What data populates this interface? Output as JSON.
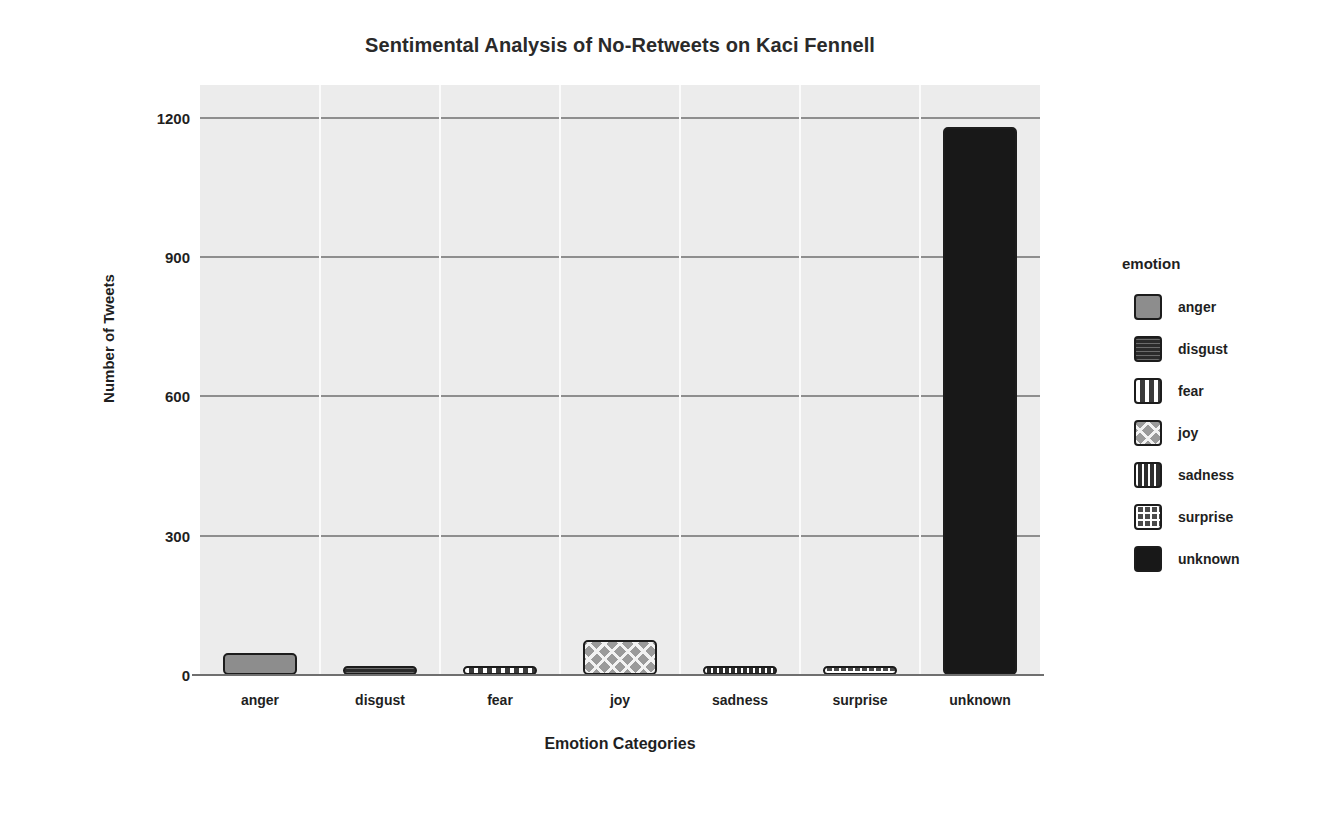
{
  "chart_data": {
    "type": "bar",
    "title": "Sentimental Analysis of No-Retweets on Kaci Fennell",
    "xlabel": "Emotion Categories",
    "ylabel": "Number of Tweets",
    "categories": [
      "anger",
      "disgust",
      "fear",
      "joy",
      "sadness",
      "surprise",
      "unknown"
    ],
    "values": [
      48,
      12,
      10,
      75,
      14,
      16,
      1180
    ],
    "ylim": [
      0,
      1270
    ],
    "yticks": [
      0,
      300,
      600,
      900,
      1200
    ],
    "ytick_labels": [
      "0",
      "300",
      "600",
      "900",
      "1200"
    ],
    "grid": "horizontal-gray-vertical-white",
    "legend": {
      "title": "emotion",
      "position": "right",
      "entries": [
        {
          "label": "anger",
          "pattern": "solid-gray"
        },
        {
          "label": "disgust",
          "pattern": "horizontal-stripe"
        },
        {
          "label": "fear",
          "pattern": "dots"
        },
        {
          "label": "joy",
          "pattern": "crosshatch"
        },
        {
          "label": "sadness",
          "pattern": "vertical-stripe"
        },
        {
          "label": "surprise",
          "pattern": "grid"
        },
        {
          "label": "unknown",
          "pattern": "solid-black"
        }
      ]
    },
    "series": [
      {
        "name": "emotion",
        "points": [
          {
            "category": "anger",
            "value": 48,
            "pattern": "solid-gray"
          },
          {
            "category": "disgust",
            "value": 12,
            "pattern": "horizontal-stripe"
          },
          {
            "category": "fear",
            "value": 10,
            "pattern": "dots"
          },
          {
            "category": "joy",
            "value": 75,
            "pattern": "crosshatch"
          },
          {
            "category": "sadness",
            "value": 14,
            "pattern": "vertical-stripe"
          },
          {
            "category": "surprise",
            "value": 16,
            "pattern": "grid"
          },
          {
            "category": "unknown",
            "value": 1180,
            "pattern": "solid-black"
          }
        ]
      }
    ],
    "colors": {
      "plot_background": "#ececec",
      "gridline": "#8e8e8e",
      "vertical_gridline": "#fbfbfb",
      "bar_outline": "#1c1c1c",
      "text": "#1f1f1f",
      "page_background": "#ffffff"
    }
  }
}
